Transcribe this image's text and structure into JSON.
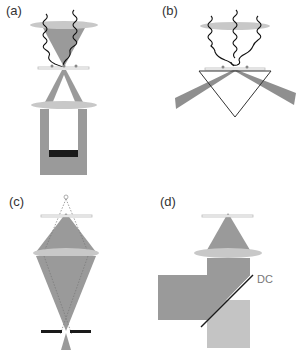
{
  "panels": {
    "a": {
      "label": "(a)"
    },
    "b": {
      "label": "(b)"
    },
    "c": {
      "label": "(c)"
    },
    "d": {
      "label": "(d)",
      "dichroic_label": "DC"
    }
  },
  "colors": {
    "beam_dark": "#8f8f8f",
    "beam_light": "#c4c4c4",
    "lens": "#c8c8c8",
    "detector": "#1a1a1a",
    "wave": "#111111",
    "slide": "#bdbdbd",
    "particle": "#888888"
  }
}
